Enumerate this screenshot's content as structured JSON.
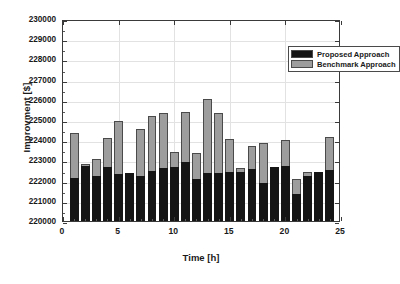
{
  "chart_data": {
    "type": "bar",
    "stacked": true,
    "title": "",
    "xlabel": "Time [h]",
    "ylabel": "Improvment [$]",
    "xlim": [
      0,
      25
    ],
    "ylim": [
      220000,
      230000
    ],
    "ytick_labels": [
      "230000",
      "229000",
      "228000",
      "227000",
      "226000",
      "225000",
      "224000",
      "223000",
      "222000",
      "221000",
      "220000"
    ],
    "ytick_values": [
      230000,
      229000,
      228000,
      227000,
      226000,
      225000,
      224000,
      223000,
      222000,
      221000,
      220000
    ],
    "xtick_labels": [
      "0",
      "5",
      "10",
      "15",
      "20",
      "25"
    ],
    "xtick_values": [
      0,
      5,
      10,
      15,
      20,
      25
    ],
    "grid": true,
    "legend_position": "upper right",
    "categories": [
      1,
      2,
      3,
      4,
      5,
      6,
      7,
      8,
      9,
      10,
      11,
      12,
      13,
      14,
      15,
      16,
      17,
      18,
      19,
      20,
      21,
      22,
      23,
      24
    ],
    "series": [
      {
        "name": "Proposed Approach",
        "color": "#151515",
        "values": [
          222150,
          222700,
          222210,
          222690,
          222350,
          222380,
          222230,
          222490,
          222620,
          222680,
          222940,
          222060,
          222400,
          222360,
          222430,
          222410,
          222570,
          221880,
          222650,
          222730,
          221320,
          222240,
          222450,
          222530
        ]
      },
      {
        "name": "Benchmark Approach",
        "color": "#9d9d9d",
        "values": [
          224350,
          222840,
          223060,
          224130,
          224930,
          222380,
          224550,
          225220,
          225370,
          223420,
          225410,
          223370,
          226030,
          225360,
          224060,
          222610,
          223710,
          223850,
          222660,
          224000,
          222070,
          222430,
          222450,
          224160
        ]
      }
    ]
  },
  "legend": {
    "items": [
      {
        "label": "Proposed Approach",
        "swatch": "black"
      },
      {
        "label": "Benchmark Approach",
        "swatch": "gray"
      }
    ]
  }
}
